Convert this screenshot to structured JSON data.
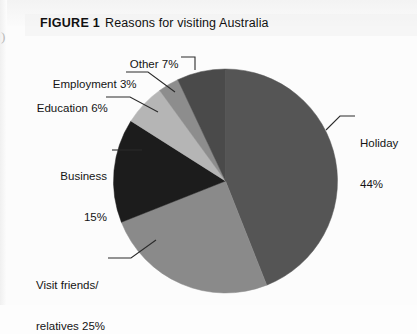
{
  "figure": {
    "label": "FIGURE 1",
    "caption": "Reasons for visiting Australia"
  },
  "artifact": {
    "mark": ")"
  },
  "chart_data": {
    "type": "pie",
    "title": "Reasons for visiting Australia",
    "categories": [
      "Holiday",
      "Visit friends/relatives",
      "Business",
      "Education",
      "Employment",
      "Other"
    ],
    "values": [
      44,
      25,
      15,
      6,
      3,
      7
    ],
    "unit": "%",
    "colors": [
      "#555555",
      "#8a8a8a",
      "#1c1c1c",
      "#b5b5b5",
      "#8d8d8d",
      "#4a4a4a"
    ],
    "start_angle_deg": 0,
    "direction": "clockwise",
    "legend": "none",
    "labels_position": "outside-with-leader-lines",
    "grid": false,
    "slices": [
      {
        "name": "Holiday",
        "value": 44,
        "label_line1": "Holiday",
        "label_line2": "44%",
        "color": "#555555"
      },
      {
        "name": "Visit friends/relatives",
        "value": 25,
        "label_line1": "Visit friends/",
        "label_line2": "relatives 25%",
        "color": "#8a8a8a"
      },
      {
        "name": "Business",
        "value": 15,
        "label_line1": "Business",
        "label_line2": "15%",
        "color": "#1c1c1c"
      },
      {
        "name": "Education",
        "value": 6,
        "label_line1": "Education 6%",
        "label_line2": "",
        "color": "#b5b5b5"
      },
      {
        "name": "Employment",
        "value": 3,
        "label_line1": "Employment 3%",
        "label_line2": "",
        "color": "#8d8d8d"
      },
      {
        "name": "Other",
        "value": 7,
        "label_line1": "Other 7%",
        "label_line2": "",
        "color": "#4a4a4a"
      }
    ]
  }
}
